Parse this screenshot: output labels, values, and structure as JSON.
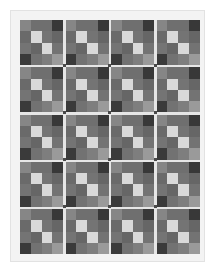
{
  "pattern": {
    "rows": 5,
    "cols": 4,
    "tile_cells": [
      [
        "#868686",
        "#6f6f6f",
        "#6f6f6f",
        "#383838"
      ],
      [
        "#6a6a6a",
        "#d9d9d9",
        "#747474",
        "#666666"
      ],
      [
        "#747474",
        "#666666",
        "#d9d9d9",
        "#737373"
      ],
      [
        "#3a3a3a",
        "#727272",
        "#7e7e7e",
        "#9a9a9a"
      ]
    ],
    "junction_color": "#4a4a4a",
    "gap_color": "#e6e6e6",
    "page_color": "#f3f3f3",
    "background_color": "#ffffff"
  }
}
